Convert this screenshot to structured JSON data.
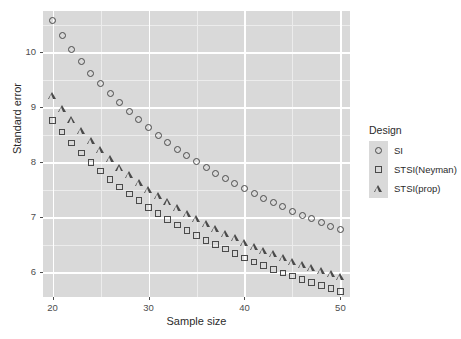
{
  "chart_data": {
    "type": "scatter",
    "title": "",
    "xlabel": "Sample size",
    "ylabel": "Standard error",
    "xlim": [
      19,
      51
    ],
    "ylim": [
      5.55,
      10.75
    ],
    "xticks": [
      20,
      30,
      40,
      50
    ],
    "yticks": [
      6,
      7,
      8,
      9,
      10
    ],
    "grid": true,
    "legend_title": "Design",
    "legend_position": "right",
    "series": [
      {
        "name": "SI",
        "marker": "circle",
        "x": [
          20,
          21,
          22,
          23,
          24,
          25,
          26,
          27,
          28,
          29,
          30,
          31,
          32,
          33,
          34,
          35,
          36,
          37,
          38,
          39,
          40,
          41,
          42,
          43,
          44,
          45,
          46,
          47,
          48,
          49,
          50
        ],
        "y": [
          10.57,
          10.3,
          10.05,
          9.83,
          9.62,
          9.43,
          9.25,
          9.08,
          8.92,
          8.77,
          8.63,
          8.49,
          8.36,
          8.24,
          8.12,
          8.01,
          7.91,
          7.8,
          7.71,
          7.61,
          7.52,
          7.43,
          7.35,
          7.27,
          7.19,
          7.11,
          7.04,
          6.97,
          6.9,
          6.83,
          6.77
        ]
      },
      {
        "name": "STSI(Neyman)",
        "marker": "square",
        "x": [
          20,
          21,
          22,
          23,
          24,
          25,
          26,
          27,
          28,
          29,
          30,
          31,
          32,
          33,
          34,
          35,
          36,
          37,
          38,
          39,
          40,
          41,
          42,
          43,
          44,
          45,
          46,
          47,
          48,
          49,
          50
        ],
        "y": [
          8.76,
          8.55,
          8.35,
          8.17,
          8.0,
          7.84,
          7.69,
          7.55,
          7.42,
          7.3,
          7.18,
          7.07,
          6.96,
          6.86,
          6.76,
          6.67,
          6.58,
          6.5,
          6.42,
          6.34,
          6.26,
          6.19,
          6.12,
          6.05,
          5.99,
          5.93,
          5.87,
          5.81,
          5.76,
          5.7,
          5.65
        ]
      },
      {
        "name": "STSI(prop)",
        "marker": "triangle",
        "x": [
          20,
          21,
          22,
          23,
          24,
          25,
          26,
          27,
          28,
          29,
          30,
          31,
          32,
          33,
          34,
          35,
          36,
          37,
          38,
          39,
          40,
          41,
          42,
          43,
          44,
          45,
          46,
          47,
          48,
          49,
          50
        ],
        "y": [
          9.21,
          8.98,
          8.77,
          8.57,
          8.39,
          8.22,
          8.06,
          7.91,
          7.77,
          7.63,
          7.51,
          7.39,
          7.28,
          7.17,
          7.07,
          6.97,
          6.88,
          6.79,
          6.7,
          6.62,
          6.54,
          6.47,
          6.4,
          6.33,
          6.26,
          6.2,
          6.14,
          6.08,
          6.02,
          5.97,
          5.92
        ]
      }
    ]
  },
  "legend": {
    "title": "Design",
    "items": [
      {
        "label": "SI",
        "marker": "circle"
      },
      {
        "label": "STSI(Neyman)",
        "marker": "square"
      },
      {
        "label": "STSI(prop)",
        "marker": "triangle"
      }
    ]
  },
  "axes": {
    "x": {
      "label": "Sample size",
      "ticks": [
        "20",
        "30",
        "40",
        "50"
      ]
    },
    "y": {
      "label": "Standard error",
      "ticks": [
        "6",
        "7",
        "8",
        "9",
        "10"
      ]
    }
  },
  "colors": {
    "panel_background": "#d9d9d9",
    "gridline_major": "#ffffff",
    "gridline_minor": "#ececec",
    "marker_stroke": "#4a4a4a",
    "text": "#2b2b2b"
  }
}
